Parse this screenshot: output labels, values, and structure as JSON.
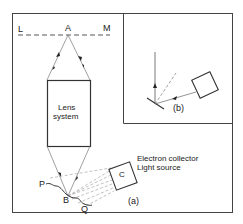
{
  "figure": {
    "panel_a": {
      "caption": "(a)",
      "line_label_left": "L",
      "line_label_right": "M",
      "point_a": "A",
      "point_b": "B",
      "surface_left": "P",
      "surface_right": "Q",
      "lens_label_line1": "Lens",
      "lens_label_line2": "system",
      "box_c_label": "C",
      "c_description_line1": "Electron collector",
      "c_description_line2": "Light source"
    },
    "panel_b": {
      "caption": "(b)"
    },
    "colors": {
      "line": "#333333",
      "dashed": "#777777",
      "frame": "#444444"
    }
  }
}
